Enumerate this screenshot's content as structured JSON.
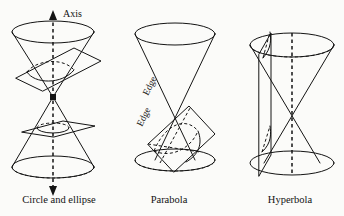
{
  "figure": {
    "title_text": "",
    "background_color": "#fbfbf9",
    "ink_color": "#141414",
    "axis_label": "Axis",
    "edge_label_upper": "Edge",
    "edge_label_lower": "Edge",
    "panels": [
      {
        "id": "panel-circle-ellipse",
        "caption": "Circle and ellipse",
        "shape": "double-cone",
        "cut_planes": [
          "tilted-plane-upper-nappe",
          "horizontal-plane-lower-nappe"
        ],
        "conic_sections": [
          "ellipse",
          "circle"
        ],
        "has_axis": true,
        "axis_style": "dashed-double-arrow"
      },
      {
        "id": "panel-parabola",
        "caption": "Parabola",
        "shape": "double-cone",
        "cut_planes": [
          "plane-parallel-to-edge"
        ],
        "conic_sections": [
          "parabola"
        ],
        "has_axis": false,
        "edge_labels": [
          "Edge",
          "Edge"
        ]
      },
      {
        "id": "panel-hyperbola",
        "caption": "Hyperbola",
        "shape": "double-cone",
        "cut_planes": [
          "vertical-plane-both-nappes"
        ],
        "conic_sections": [
          "hyperbola"
        ],
        "has_axis": true,
        "axis_style": "dashed-vertical"
      }
    ]
  }
}
